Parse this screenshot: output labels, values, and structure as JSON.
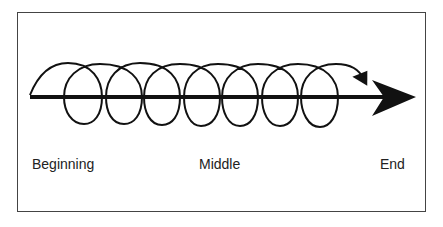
{
  "diagram": {
    "type": "spiral-progression-timeline",
    "labels": {
      "beginning": "Beginning",
      "middle": "Middle",
      "end": "End"
    },
    "loop_count": 7,
    "colors": {
      "stroke": "#111111",
      "frame": "#444444",
      "text": "#222222"
    }
  }
}
